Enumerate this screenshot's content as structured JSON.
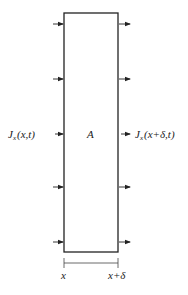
{
  "diagram": {
    "region_label": "A",
    "flux_in_label": {
      "symbol": "J",
      "subscript": "x",
      "args": "(x,t)"
    },
    "flux_out_label": {
      "symbol": "J",
      "subscript": "x",
      "args": "(x+δ,t)"
    },
    "dimension_left": "x",
    "dimension_right": "x+δ",
    "arrow_rows": 5,
    "colors": {
      "stroke": "#222222",
      "background": "#ffffff"
    }
  }
}
